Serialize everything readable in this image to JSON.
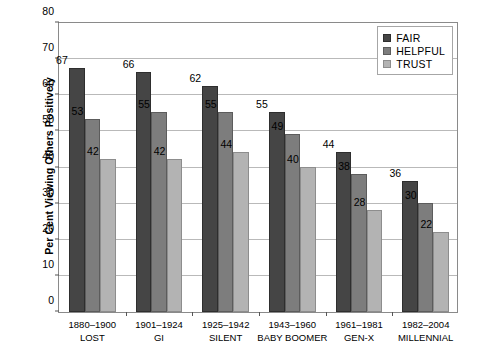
{
  "chart_data": {
    "type": "bar",
    "title": "",
    "xlabel": "",
    "ylabel": "Per Cent Viewing Others Positively",
    "ylim": [
      0,
      80
    ],
    "ytick_step": 10,
    "yticks": [
      0,
      10,
      20,
      30,
      40,
      50,
      60,
      70,
      80
    ],
    "grid": true,
    "legend_position": "top-right inside plot",
    "categories": [
      "1880–1900 LOST",
      "1901–1924 GI",
      "1925–1942 SILENT",
      "1943–1960 BABY BOOMER",
      "1961–1981 GEN-X",
      "1982–2004 MILLENNIAL"
    ],
    "category_lines": [
      [
        "1880–1900",
        "LOST"
      ],
      [
        "1901–1924",
        "GI"
      ],
      [
        "1925–1942",
        "SILENT"
      ],
      [
        "1943–1960",
        "BABY BOOMER"
      ],
      [
        "1961–1981",
        "GEN-X"
      ],
      [
        "1982–2004",
        "MILLENNIAL"
      ]
    ],
    "series": [
      {
        "name": "FAIR",
        "color": "#454545",
        "values": [
          67,
          66,
          62,
          55,
          44,
          36
        ]
      },
      {
        "name": "HELPFUL",
        "color": "#7d7d7d",
        "values": [
          53,
          55,
          55,
          49,
          38,
          30
        ]
      },
      {
        "name": "TRUST",
        "color": "#b3b3b3",
        "values": [
          42,
          42,
          44,
          40,
          28,
          22
        ]
      }
    ]
  },
  "legend": {
    "items": [
      {
        "label": "FAIR"
      },
      {
        "label": "HELPFUL"
      },
      {
        "label": "TRUST"
      }
    ]
  }
}
